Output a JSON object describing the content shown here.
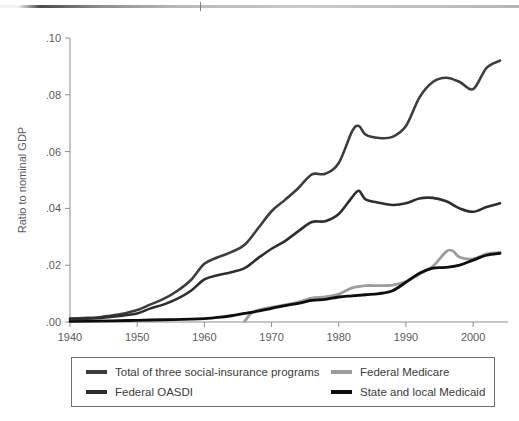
{
  "decorations": {
    "top_rule_name": "header-gradient-rule"
  },
  "chart_data": {
    "type": "line",
    "title": "",
    "xlabel": "",
    "ylabel": "Ratio to nominal GDP",
    "xlim": [
      1940,
      2004
    ],
    "ylim": [
      0.0,
      0.1
    ],
    "grid": false,
    "legend_position": "bottom",
    "xticks": [
      1940,
      1950,
      1960,
      1970,
      1980,
      1990,
      2000
    ],
    "xtick_labels": [
      "1940",
      "1950",
      "1960",
      "1970",
      "1980",
      "1990",
      "2000"
    ],
    "yticks": [
      0.0,
      0.02,
      0.04,
      0.06,
      0.08,
      0.1
    ],
    "ytick_labels": [
      ".00",
      ".02",
      ".04",
      ".06",
      ".08",
      ".10"
    ],
    "series": [
      {
        "name": "Total of three social-insurance programs",
        "color": "#3d3d3d",
        "width": 2.6,
        "x": [
          1940,
          1942,
          1944,
          1946,
          1948,
          1950,
          1952,
          1954,
          1956,
          1958,
          1960,
          1962,
          1964,
          1966,
          1968,
          1970,
          1972,
          1974,
          1976,
          1978,
          1980,
          1982,
          1983,
          1984,
          1986,
          1988,
          1990,
          1992,
          1994,
          1996,
          1998,
          2000,
          2002,
          2004
        ],
        "values": [
          0.0012,
          0.0014,
          0.0016,
          0.0022,
          0.003,
          0.0042,
          0.0062,
          0.0082,
          0.011,
          0.0148,
          0.0205,
          0.0228,
          0.0246,
          0.0272,
          0.033,
          0.039,
          0.043,
          0.0472,
          0.052,
          0.0522,
          0.056,
          0.0672,
          0.069,
          0.066,
          0.0648,
          0.0652,
          0.069,
          0.079,
          0.0845,
          0.086,
          0.0845,
          0.082,
          0.0895,
          0.092
        ]
      },
      {
        "name": "Federal OASDI",
        "color": "#2e2e2e",
        "width": 2.6,
        "x": [
          1940,
          1942,
          1944,
          1946,
          1948,
          1950,
          1952,
          1954,
          1956,
          1958,
          1960,
          1962,
          1964,
          1966,
          1968,
          1970,
          1972,
          1974,
          1976,
          1978,
          1980,
          1982,
          1983,
          1984,
          1986,
          1988,
          1990,
          1992,
          1994,
          1996,
          1998,
          2000,
          2002,
          2004
        ],
        "values": [
          0.001,
          0.0011,
          0.0013,
          0.0018,
          0.0023,
          0.003,
          0.0048,
          0.0062,
          0.0082,
          0.011,
          0.015,
          0.0165,
          0.0175,
          0.019,
          0.0225,
          0.0258,
          0.0285,
          0.032,
          0.0352,
          0.0355,
          0.038,
          0.044,
          0.0462,
          0.0432,
          0.042,
          0.0412,
          0.0418,
          0.0435,
          0.0437,
          0.0425,
          0.04,
          0.0388,
          0.0405,
          0.0418
        ]
      },
      {
        "name": "Federal Medicare",
        "color": "#9d9d9d",
        "width": 2.8,
        "x": [
          1966,
          1967,
          1968,
          1970,
          1972,
          1974,
          1976,
          1978,
          1980,
          1982,
          1984,
          1986,
          1988,
          1990,
          1992,
          1994,
          1996,
          1997,
          1998,
          2000,
          2002,
          2004
        ],
        "values": [
          0.0002,
          0.0032,
          0.0042,
          0.0052,
          0.006,
          0.007,
          0.0084,
          0.0088,
          0.0098,
          0.012,
          0.0128,
          0.0128,
          0.013,
          0.0142,
          0.0168,
          0.0196,
          0.0248,
          0.025,
          0.0228,
          0.0222,
          0.024,
          0.0245
        ]
      },
      {
        "name": "State and local Medicaid",
        "color": "#0d0d0d",
        "width": 2.8,
        "x": [
          1940,
          1946,
          1950,
          1954,
          1958,
          1960,
          1962,
          1964,
          1966,
          1968,
          1970,
          1972,
          1974,
          1976,
          1978,
          1980,
          1982,
          1984,
          1986,
          1988,
          1990,
          1992,
          1994,
          1996,
          1998,
          2000,
          2002,
          2004
        ],
        "values": [
          0.0002,
          0.0004,
          0.0006,
          0.0008,
          0.001,
          0.0012,
          0.0016,
          0.0022,
          0.003,
          0.0038,
          0.0048,
          0.0058,
          0.0066,
          0.0076,
          0.008,
          0.0088,
          0.0092,
          0.0096,
          0.01,
          0.011,
          0.014,
          0.0172,
          0.019,
          0.0192,
          0.02,
          0.0218,
          0.0235,
          0.0242
        ]
      }
    ]
  },
  "legend": {
    "items": [
      {
        "label": "Total of three social-insurance programs",
        "color": "#3d3d3d",
        "name": "legend-item-total"
      },
      {
        "label": "Federal Medicare",
        "color": "#9d9d9d",
        "name": "legend-item-medicare"
      },
      {
        "label": "Federal OASDI",
        "color": "#2e2e2e",
        "name": "legend-item-oasdi"
      },
      {
        "label": "State and local Medicaid",
        "color": "#0d0d0d",
        "name": "legend-item-medicaid"
      }
    ]
  }
}
